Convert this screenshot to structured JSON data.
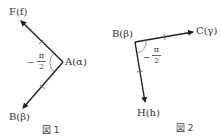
{
  "figure1": {
    "caption": "図 1",
    "vertex": {
      "label": "A(α)"
    },
    "arrow_upper": {
      "label": "F(f)"
    },
    "arrow_lower": {
      "label": "B(β)"
    },
    "angle": {
      "sign": "−",
      "numerator": "π",
      "denominator": "2"
    },
    "equal_length_marks": true
  },
  "figure2": {
    "caption": "図 2",
    "vertex": {
      "label": "B(β)"
    },
    "arrow_right": {
      "label": "C(γ)"
    },
    "arrow_down": {
      "label": "H(h)"
    },
    "angle": {
      "sign": "−",
      "numerator": "π",
      "denominator": "2"
    },
    "equal_length_marks": true
  },
  "colors": {
    "line": "#222222",
    "arc": "#777777",
    "text": "#333333"
  }
}
